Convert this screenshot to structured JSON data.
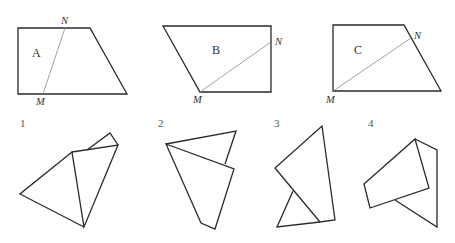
{
  "shapes": [
    {
      "id": "A",
      "label": "A",
      "point_n": "N",
      "point_m": "M"
    },
    {
      "id": "B",
      "label": "B",
      "point_n": "N",
      "point_m": "M"
    },
    {
      "id": "C",
      "label": "C",
      "point_n": "N",
      "point_m": "M"
    }
  ],
  "folded_figures": [
    {
      "number": "1"
    },
    {
      "number": "2"
    },
    {
      "number": "3"
    },
    {
      "number": "4"
    }
  ],
  "colors": {
    "edge": "#2a2a2a",
    "cut_line": "#8a8a8a",
    "text": "#333333"
  }
}
